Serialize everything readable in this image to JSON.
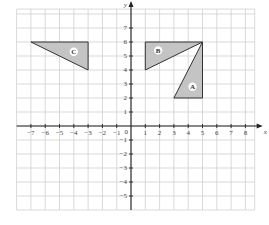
{
  "chart_data": {
    "type": "diagram",
    "title": "",
    "xlabel": "x",
    "ylabel": "y",
    "xlim": [
      -8,
      9
    ],
    "ylim": [
      -6,
      8
    ],
    "x_ticks": [
      -7,
      -6,
      -5,
      -4,
      -3,
      -2,
      -1,
      1,
      2,
      3,
      4,
      5,
      6,
      7,
      8
    ],
    "y_ticks": [
      -5,
      -4,
      -3,
      -2,
      -1,
      1,
      2,
      3,
      4,
      5,
      6,
      7
    ],
    "origin_label": "0",
    "grid": true,
    "shapes": [
      {
        "label": "A",
        "type": "triangle",
        "vertices": [
          [
            3,
            2
          ],
          [
            5,
            2
          ],
          [
            5,
            6
          ]
        ],
        "label_at": [
          4.3,
          2.8
        ]
      },
      {
        "label": "B",
        "type": "triangle",
        "vertices": [
          [
            1,
            6
          ],
          [
            5,
            6
          ],
          [
            1,
            4
          ]
        ],
        "label_at": [
          1.9,
          5.4
        ]
      },
      {
        "label": "C",
        "type": "triangle",
        "vertices": [
          [
            -7,
            6
          ],
          [
            -3,
            6
          ],
          [
            -3,
            4
          ]
        ],
        "label_at": [
          -4.0,
          5.3
        ]
      }
    ],
    "colors": {
      "fill": "#c4c4c4",
      "stroke": "#333333",
      "grid": "#cfcfcf",
      "axis": "#222222"
    }
  }
}
